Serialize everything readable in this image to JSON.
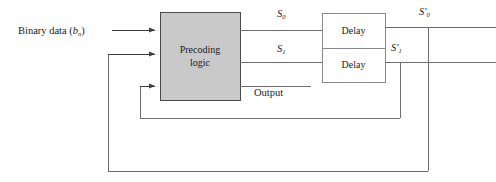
{
  "figure": {
    "type": "block-diagram",
    "canvas": {
      "width": 496,
      "height": 182
    },
    "colors": {
      "line": "#6e6e6e",
      "text": "#1a1a1a",
      "precoding_fill": "#c9c9c9",
      "precoding_stroke": "#4a4a4a",
      "delay_fill": "#ffffff",
      "delay_stroke": "#8a8a8a",
      "background": "#ffffff"
    }
  },
  "blocks": {
    "precoding": {
      "label_line1": "Precoding",
      "label_line2": "logic",
      "x": 160,
      "y": 12,
      "width": 80,
      "height": 88
    },
    "delay_top": {
      "label": "Delay",
      "x": 322,
      "y": 13,
      "width": 63,
      "height": 35
    },
    "delay_bottom": {
      "label": "Delay",
      "x": 322,
      "y": 48,
      "width": 63,
      "height": 34
    }
  },
  "labels": {
    "binary_data": "Binary data (",
    "binary_data_var": "b",
    "binary_data_sub": "n",
    "binary_data_close": ")",
    "s0": "S",
    "s0_sub": "0",
    "s1": "S",
    "s1_sub": "1",
    "s0_primed": "S",
    "s0_primed_mark": "′",
    "s0_primed_sub": "0",
    "s1_primed": "S",
    "s1_primed_mark": "′",
    "s1_primed_sub": "1",
    "output": "Output"
  },
  "signals": [
    {
      "name": "binary-data-input",
      "from": "external-left",
      "to": "precoding-input-1",
      "y": 30
    },
    {
      "name": "feedback-s0-primed",
      "from": "s0-primed-tap",
      "to": "precoding-input-2",
      "y": 54
    },
    {
      "name": "feedback-s1-primed",
      "from": "s1-primed-tap",
      "to": "precoding-input-3",
      "y": 86
    },
    {
      "name": "s0-to-delay-top",
      "from": "precoding-output-1",
      "to": "delay-top-input",
      "y": 30
    },
    {
      "name": "s1-to-delay-bottom",
      "from": "precoding-output-2",
      "to": "delay-bottom-input",
      "y": 62
    },
    {
      "name": "output-line",
      "from": "precoding-output-3",
      "to": "output-terminal",
      "y": 86
    },
    {
      "name": "s0-primed-out",
      "from": "delay-top-output",
      "to": "external-right",
      "y": 27
    },
    {
      "name": "s1-primed-out",
      "from": "delay-bottom-output",
      "to": "external-right",
      "y": 62
    }
  ]
}
